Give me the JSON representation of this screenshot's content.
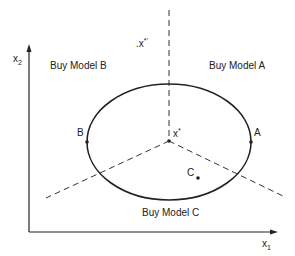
{
  "diagram": {
    "axes": {
      "x_label": "x",
      "x_sub": "1",
      "y_label": "x",
      "y_sub": "2"
    },
    "regions": [
      {
        "label": "Buy Model  B"
      },
      {
        "label": "Buy Model  A"
      },
      {
        "label": "Buy Model C"
      }
    ],
    "points": {
      "ideal": {
        "label": "x",
        "sup": "*"
      },
      "ideal_prime": {
        "label": ".x",
        "sup": "*'"
      },
      "A": {
        "label": "A"
      },
      "B": {
        "label": "B"
      },
      "C": {
        "label": "C"
      }
    },
    "colors": {
      "ink": "#222222",
      "background": "#ffffff"
    }
  }
}
